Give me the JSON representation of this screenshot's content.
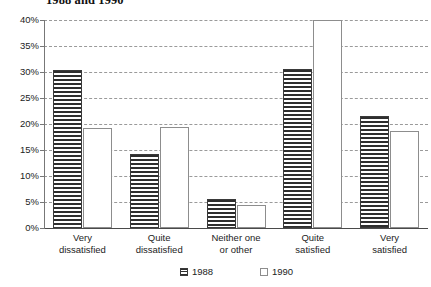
{
  "chart_data": {
    "type": "bar",
    "title": "1988 and 1990",
    "xlabel": "",
    "ylabel": "",
    "ylim": [
      0,
      40
    ],
    "ytick_labels": [
      "40%",
      "35%",
      "30%",
      "25%",
      "20%",
      "15%",
      "10%",
      "5%",
      "0%"
    ],
    "ytick_values": [
      40,
      35,
      30,
      25,
      20,
      15,
      10,
      5,
      0
    ],
    "grid": true,
    "legend_position": "bottom",
    "categories": [
      "Very\ndissatisfied",
      "Quite\ndissatisfied",
      "Neither one\nor other",
      "Quite\nsatisfied",
      "Very\nsatisfied"
    ],
    "category_lines": [
      [
        "Very",
        "dissatisfied"
      ],
      [
        "Quite",
        "dissatisfied"
      ],
      [
        "Neither one",
        "or other"
      ],
      [
        "Quite",
        "satisfied"
      ],
      [
        "Very",
        "satisfied"
      ]
    ],
    "series": [
      {
        "name": "1988",
        "values": [
          30.4,
          14.2,
          5.6,
          30.6,
          21.6
        ]
      },
      {
        "name": "1990",
        "values": [
          19.2,
          19.5,
          4.5,
          40.0,
          18.6
        ]
      }
    ]
  },
  "legend": {
    "items": [
      {
        "label": "1988",
        "swatch": "hatched-swatch-icon"
      },
      {
        "label": "1990",
        "swatch": "empty-swatch-icon"
      }
    ]
  }
}
